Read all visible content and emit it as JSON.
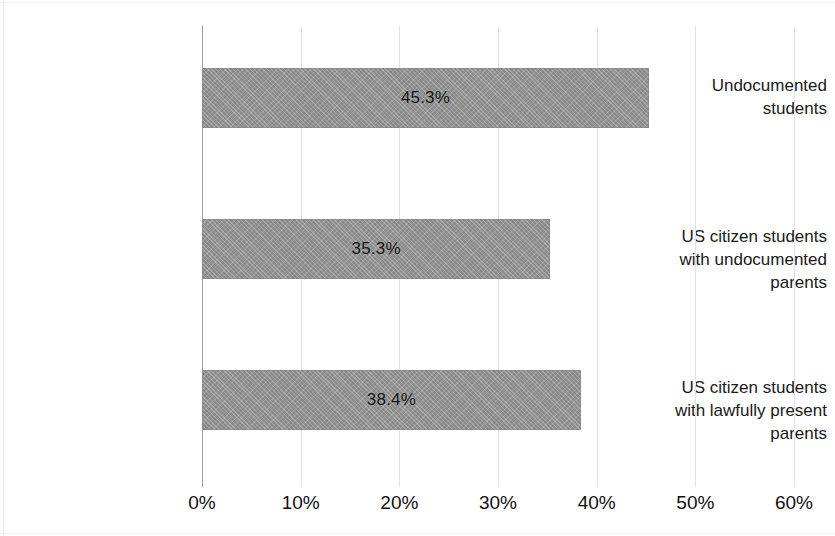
{
  "chart_data": {
    "type": "bar",
    "orientation": "horizontal",
    "title": "",
    "subtitle": "",
    "xlabel": "",
    "ylabel": "",
    "xlim": [
      0,
      60
    ],
    "grid": true,
    "legend": false,
    "value_suffix": "%",
    "categories": [
      "Undocumented students",
      "US citizen students with undocumented parents",
      "US citizen students with lawfully present parents"
    ],
    "values": [
      45.3,
      35.3,
      38.4
    ],
    "data_labels": [
      "45.3%",
      "35.3%",
      "38.4%"
    ],
    "xticks": [
      0,
      10,
      20,
      30,
      40,
      50,
      60
    ],
    "xtick_labels": [
      "0%",
      "10%",
      "20%",
      "30%",
      "40%",
      "50%",
      "60%"
    ],
    "bar_color": "#979797",
    "gridline_color": "#e2e2e2",
    "axis_color": "#9d9d9d",
    "text_color": "#111111"
  },
  "categories_lines": [
    [
      "Undocumented",
      "students"
    ],
    [
      "US citizen students",
      "with undocumented",
      "parents"
    ],
    [
      "US citizen students",
      "with lawfully present",
      "parents"
    ]
  ]
}
